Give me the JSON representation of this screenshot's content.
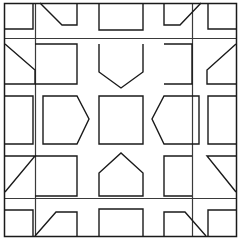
{
  "figure": {
    "width": 241,
    "height": 239,
    "background_color": "#ffffff",
    "stroke_color": "#1a1a1a",
    "stroke_width": 1.4,
    "overlay_stroke_width": 1.2
  },
  "chart_data": {
    "type": "diagram",
    "xlabel": "",
    "ylabel": "",
    "xlim": [
      0,
      241
    ],
    "ylim": [
      0,
      239
    ],
    "grid": false,
    "legend": "none",
    "grid_columns": 5,
    "grid_rows": 5,
    "cell_centers_x": [
      20,
      66,
      120,
      174,
      220
    ],
    "cell_centers_y": [
      20,
      64,
      119,
      174,
      218
    ],
    "outer_frame": {
      "name": "outer-border",
      "x": 4,
      "y": 3,
      "width": 233,
      "height": 233
    },
    "overlay_squares": [
      {
        "name": "overlay-square-large",
        "x": 4,
        "y": 3,
        "width": 233,
        "height": 233
      },
      {
        "name": "overlay-square-outer-inset",
        "x": 5,
        "y": 38,
        "width": 228,
        "height": 160
      },
      {
        "name": "overlay-square-inner",
        "x": 35,
        "y": 3,
        "width": 158,
        "height": 233
      },
      {
        "name": "overlay-square-middle",
        "x": 35,
        "y": 38,
        "width": 158,
        "height": 160
      },
      {
        "name": "overlay-square-center-band",
        "x": 80,
        "y": 82,
        "width": 77,
        "height": 74
      }
    ],
    "motifs": [
      {
        "id": "r1c1",
        "row": 1,
        "col": 1,
        "shape": "corner-square",
        "note": "small square open at bottom-left"
      },
      {
        "id": "r1c2",
        "row": 1,
        "col": 2,
        "shape": "diagonal-cut-square",
        "note": "square with top-left corner cut by diagonal"
      },
      {
        "id": "r1c3",
        "row": 1,
        "col": 3,
        "shape": "open-square",
        "note": "square open at top"
      },
      {
        "id": "r1c4",
        "row": 1,
        "col": 4,
        "shape": "diagonal-cut-square",
        "note": "square with top-right corner cut by diagonal"
      },
      {
        "id": "r1c5",
        "row": 1,
        "col": 5,
        "shape": "corner-square",
        "note": "small square open at bottom-right"
      },
      {
        "id": "r2c1",
        "row": 2,
        "col": 1,
        "shape": "diagonal-cut-square",
        "note": "left cell, diagonal from top-left down to right"
      },
      {
        "id": "r2c2",
        "row": 2,
        "col": 2,
        "shape": "open-square",
        "note": "large square open at left"
      },
      {
        "id": "r2c3",
        "row": 2,
        "col": 3,
        "shape": "pentagon-down",
        "note": "pentagon pointing down"
      },
      {
        "id": "r2c4",
        "row": 2,
        "col": 4,
        "shape": "open-square",
        "note": "large square open at right"
      },
      {
        "id": "r2c5",
        "row": 2,
        "col": 5,
        "shape": "diagonal-cut-square",
        "note": "right cell, diagonal from top-right down to left"
      },
      {
        "id": "r3c1",
        "row": 3,
        "col": 1,
        "shape": "open-square",
        "note": "square open at left edge"
      },
      {
        "id": "r3c2",
        "row": 3,
        "col": 2,
        "shape": "pentagon-right",
        "note": "pentagon pointing right"
      },
      {
        "id": "r3c3",
        "row": 3,
        "col": 3,
        "shape": "square",
        "note": "plain centre square"
      },
      {
        "id": "r3c4",
        "row": 3,
        "col": 4,
        "shape": "pentagon-left",
        "note": "pentagon pointing left"
      },
      {
        "id": "r3c5",
        "row": 3,
        "col": 5,
        "shape": "open-square",
        "note": "square open at right edge"
      },
      {
        "id": "r4c1",
        "row": 4,
        "col": 1,
        "shape": "diagonal-cut-square",
        "note": "left cell, diagonal from bottom-left up to right"
      },
      {
        "id": "r4c2",
        "row": 4,
        "col": 2,
        "shape": "open-square",
        "note": "large square open at left"
      },
      {
        "id": "r4c3",
        "row": 4,
        "col": 3,
        "shape": "pentagon-up",
        "note": "pentagon pointing up, house shape"
      },
      {
        "id": "r4c4",
        "row": 4,
        "col": 4,
        "shape": "open-square",
        "note": "large square open at right"
      },
      {
        "id": "r4c5",
        "row": 4,
        "col": 5,
        "shape": "diagonal-cut-square",
        "note": "right cell, diagonal from bottom-right up to left"
      },
      {
        "id": "r5c1",
        "row": 5,
        "col": 1,
        "shape": "corner-square",
        "note": "small square open at top-left"
      },
      {
        "id": "r5c2",
        "row": 5,
        "col": 2,
        "shape": "diagonal-cut-square",
        "note": "square with bottom-left corner cut by diagonal"
      },
      {
        "id": "r5c3",
        "row": 5,
        "col": 3,
        "shape": "open-square",
        "note": "square open at bottom"
      },
      {
        "id": "r5c4",
        "row": 5,
        "col": 4,
        "shape": "diagonal-cut-square",
        "note": "square with bottom-right corner cut by diagonal"
      },
      {
        "id": "r5c5",
        "row": 5,
        "col": 5,
        "shape": "corner-square",
        "note": "small square open at top-right"
      }
    ],
    "paths": {
      "outer_border": "M4.5,3.5 H236.5 V236.5 H4.5 Z",
      "overlay_v_left": "M35.5,3.5 V236.5",
      "overlay_v_right": "M192.5,3.5 V236.5",
      "overlay_h_top": "M4.5,38.5 H236.5",
      "overlay_h_bottom": "M4.5,198.5 H236.5",
      "center_square": "M100.5,99.5 H142.5 V141.5 H100.5 Z",
      "r1c1": "M5,29 H33 V3",
      "r1c2": "M40,3 L62,25 H77 V3",
      "r1c3": "M99,3 V30 H143 V3",
      "r1c4": "M164,3 V25 H180 L201,3",
      "r1c5": "M208,3 V29 H236",
      "r2c1": "M5,44 L35,70 V84 H5",
      "r2c2": "M35,44 H77 V84 H35",
      "r2c3": "M99,44 V72 L121,88 L143,72 V44",
      "r2c4": "M164,44 H192 V84 H164",
      "r2c5": "M236,44 L207,70 V84 H236",
      "r3c1": "M5,96 H33 V144 H5",
      "r3c2": "M43,96 H77 L89,119 L77,144 H43 Z",
      "r3c3": "M99,96 H143 V144 H99 Z",
      "r3c4": "M199,96 H164 L152,119 L164,144 H199 Z",
      "r3c5": "M236,96 H208 V144 H236",
      "r4c1": "M5,156 H35 L5,192 ",
      "r4c2": "M35,156 H77 V196 H35",
      "r4c3": "M99,196 V173 L121,153 L143,173 V196 Z",
      "r4c4": "M192,156 H164 V196 H192",
      "r4c5": "M236,156 H207 L236,192",
      "r5c1": "M5,210 H33 V236",
      "r5c2": "M35,236 L56,212 H77 V236",
      "r5c3": "M99,236 V209 H143 V236",
      "r5c4": "M164,236 V212 H185 L206,236",
      "r5c5": "M208,236 V210 H236"
    }
  }
}
